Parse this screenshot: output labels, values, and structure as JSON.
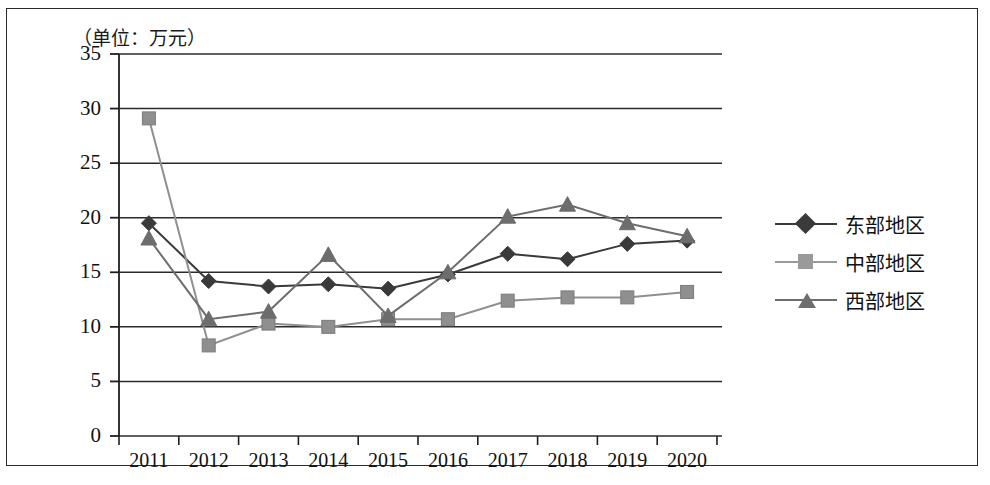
{
  "chart_data": {
    "type": "line",
    "title": "",
    "unit_note": "（单位：万元）",
    "xlabel": "",
    "ylabel": "",
    "categories": [
      "2011",
      "2012",
      "2013",
      "2014",
      "2015",
      "2016",
      "2017",
      "2018",
      "2019",
      "2020"
    ],
    "ylim": [
      0,
      35
    ],
    "ytick_labels": [
      "0",
      "5",
      "10",
      "15",
      "20",
      "25",
      "30",
      "35"
    ],
    "ytick_values": [
      0,
      5,
      10,
      15,
      20,
      25,
      30,
      35
    ],
    "grid": "horizontal",
    "legend_position": "right",
    "series": [
      {
        "name": "东部地区",
        "marker": "diamond",
        "color": "#3a3a3a",
        "values": [
          19.5,
          14.2,
          13.7,
          13.9,
          13.5,
          14.8,
          16.7,
          16.2,
          17.6,
          17.9
        ]
      },
      {
        "name": "中部地区",
        "marker": "square",
        "color": "#8f8f8f",
        "values": [
          29.1,
          8.3,
          10.3,
          10.0,
          10.7,
          10.7,
          12.4,
          12.7,
          12.7,
          13.2
        ]
      },
      {
        "name": "西部地区",
        "marker": "triangle",
        "color": "#6d6d6d",
        "values": [
          18.1,
          10.7,
          11.4,
          16.6,
          11.0,
          15.0,
          20.1,
          21.2,
          19.5,
          18.3
        ]
      }
    ]
  },
  "axis": {
    "ytick_labels": [
      "35",
      "30",
      "25",
      "20",
      "15",
      "10",
      "5",
      "0"
    ],
    "xtick_labels": [
      "2011",
      "2012",
      "2013",
      "2014",
      "2015",
      "2016",
      "2017",
      "2018",
      "2019",
      "2020"
    ]
  },
  "legend": {
    "items": [
      {
        "label": "东部地区"
      },
      {
        "label": "中部地区"
      },
      {
        "label": "西部地区"
      }
    ]
  },
  "colors": {
    "east": "#3a3a3a",
    "central": "#8f8f8f",
    "west": "#6d6d6d",
    "axis": "#1f1f1f",
    "grid": "#2b2b2b",
    "frame": "#2b2b2b"
  }
}
